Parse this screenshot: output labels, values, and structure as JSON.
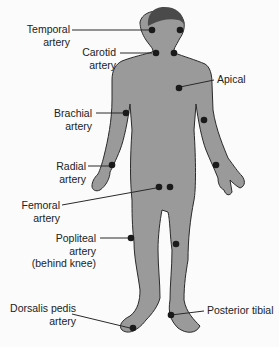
{
  "colors": {
    "body_fill": "#9a9a9a",
    "body_stroke": "#2a2a2a",
    "hair": "#4a4a4a",
    "point": "#1a1a1a",
    "background": "#fbfbfb",
    "text": "#222222"
  },
  "labels": {
    "temporal": [
      "Temporal",
      "artery"
    ],
    "carotid": [
      "Carotid",
      "artery"
    ],
    "apical": [
      "Apical"
    ],
    "brachial": [
      "Brachial",
      "artery"
    ],
    "radial": [
      "Radial",
      "artery"
    ],
    "femoral": [
      "Femoral",
      "artery"
    ],
    "popliteal": [
      "Popliteal",
      "artery",
      "(behind knee)"
    ],
    "dorsalis": [
      "Dorsalis pedis",
      "artery"
    ],
    "posterior_tibial": [
      "Posterior tibial"
    ]
  }
}
